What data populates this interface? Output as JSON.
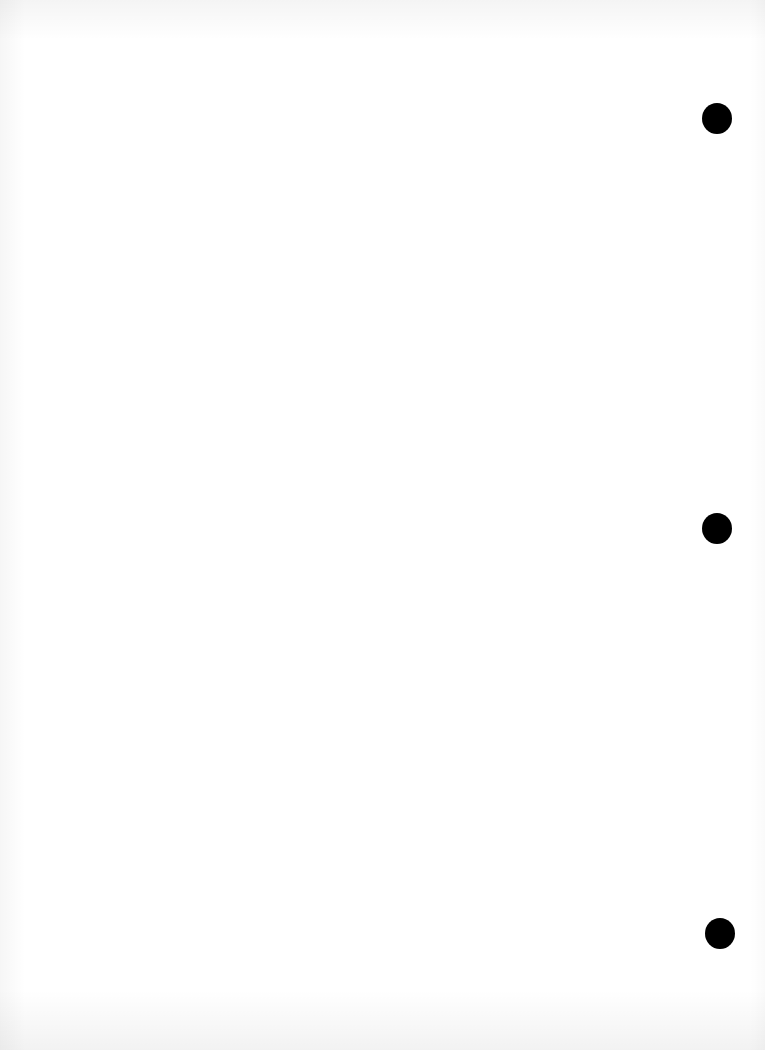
{
  "document": {
    "type": "blank three-hole-punched sheet",
    "text_content": "",
    "background_color": "#ffffff",
    "punch_holes": [
      {
        "label": "top-hole",
        "cx": 717,
        "cy": 118,
        "diameter": 30,
        "color": "#000000"
      },
      {
        "label": "middle-hole",
        "cx": 717,
        "cy": 528,
        "diameter": 30,
        "color": "#000000"
      },
      {
        "label": "bottom-hole",
        "cx": 720,
        "cy": 933,
        "diameter": 30,
        "color": "#000000"
      }
    ]
  }
}
